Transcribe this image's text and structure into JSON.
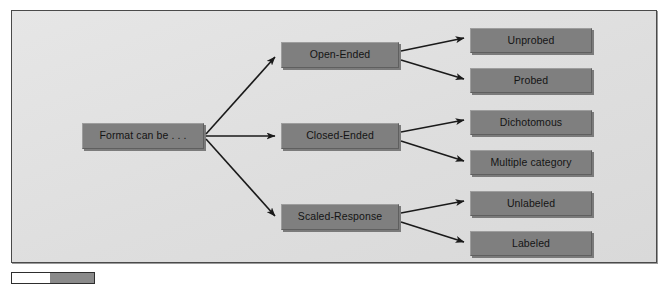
{
  "figure": {
    "root": {
      "label": "Format can be . . ."
    },
    "branches": [
      {
        "label": "Open-Ended",
        "children": [
          {
            "label": "Unprobed"
          },
          {
            "label": "Probed"
          }
        ]
      },
      {
        "label": "Closed-Ended",
        "children": [
          {
            "label": "Dichotomous"
          },
          {
            "label": "Multiple category"
          }
        ]
      },
      {
        "label": "Scaled-Response",
        "children": [
          {
            "label": "Unlabeled"
          },
          {
            "label": "Labeled"
          }
        ]
      }
    ],
    "colors": {
      "panel_background": "#e2e2e2",
      "panel_border": "#4a4a4a",
      "node_fill": "#7f7f7f",
      "node_text": "#141414",
      "arrow": "#1a1a1a"
    }
  }
}
